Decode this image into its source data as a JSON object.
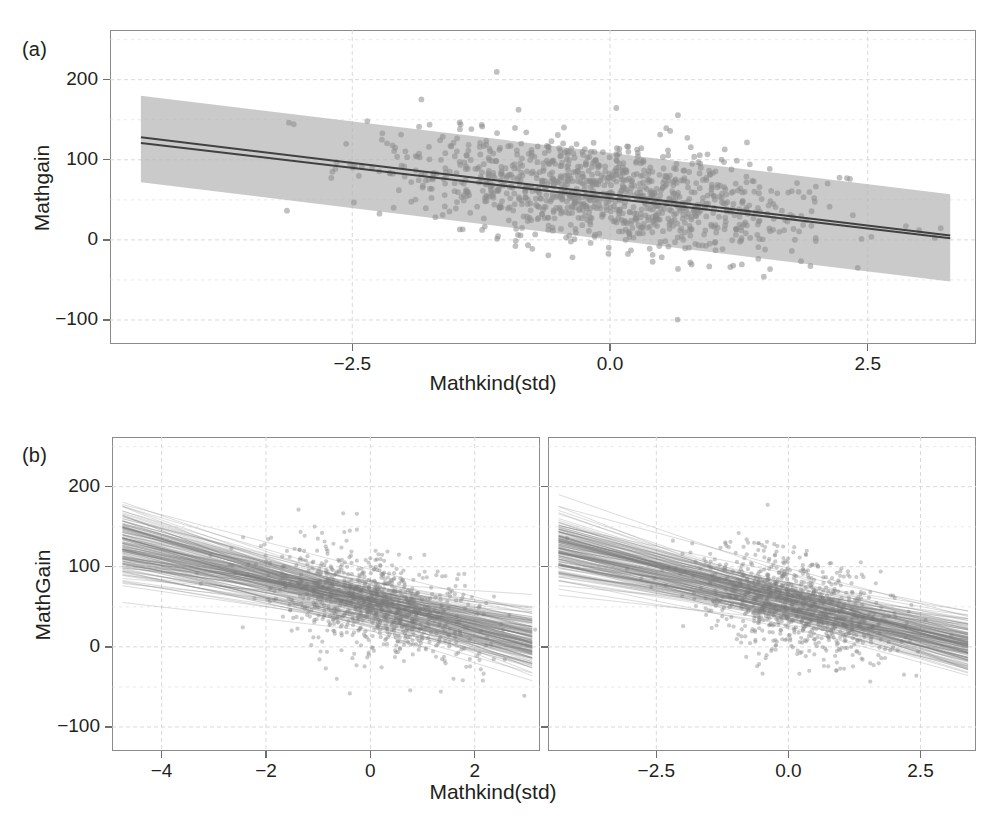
{
  "figure": {
    "panels": [
      {
        "letter": "(a)",
        "xlabel": "Mathkind(std)",
        "ylabel": "Mathgain"
      },
      {
        "letter": "(b)",
        "xlabel": "Mathkind(std)",
        "ylabel": "MathGain"
      }
    ]
  },
  "colors": {
    "point": "#8c8c8c",
    "band": "#b3b3b3",
    "line": "#3a3a3a",
    "spaghetti": "#7a7a7a",
    "grid": "#d8d8d8",
    "frame": "#8a8a8a",
    "text": "#231f20"
  },
  "chart_data": [
    {
      "type": "scatter",
      "panel": "(a)",
      "title": "",
      "xlabel": "Mathkind(std)",
      "ylabel": "Mathgain",
      "xlim": [
        -4.85,
        3.55
      ],
      "ylim": [
        -130,
        262
      ],
      "xticks": [
        -2.5,
        0.0,
        2.5
      ],
      "xticklabels": [
        "-2.5",
        "0.0",
        "2.5"
      ],
      "yticks": [
        -100,
        0,
        100,
        200
      ],
      "yticklabels": [
        "-100",
        "0",
        "100",
        "200"
      ],
      "grid": true,
      "grid_minor_y_step": 50,
      "legend": "none",
      "n_points": 1100,
      "point_cloud": {
        "x_mean": 0.0,
        "x_sd": 1.0,
        "y_intercept": 58,
        "y_slope": -15.6,
        "y_resid_sd": 32
      },
      "fit_lines": [
        {
          "name": "pooled-regression",
          "intercept": 57.0,
          "slope": -15.6,
          "x0": -4.55,
          "y0": 128.0,
          "x1": 3.3,
          "y1": 5.5
        },
        {
          "name": "multilevel-regression",
          "intercept": 52.0,
          "slope": -15.2,
          "x0": -4.55,
          "y0": 121.0,
          "x1": 3.3,
          "y1": 2.0
        }
      ],
      "confidence_band": {
        "name": "95% prediction interval",
        "x0": -4.55,
        "x1": 3.3,
        "upper_y0": 180.0,
        "upper_y1": 57.0,
        "lower_y0": 72.0,
        "lower_y1": -52.0
      }
    },
    {
      "type": "line",
      "panel": "(b)-left",
      "title": "",
      "xlabel": "Mathkind(std)",
      "ylabel": "MathGain",
      "xlim": [
        -4.95,
        3.25
      ],
      "ylim": [
        -130,
        262
      ],
      "xticks": [
        -4,
        -2,
        0,
        2
      ],
      "xticklabels": [
        "-4",
        "-2",
        "0",
        "2"
      ],
      "yticks": [
        -100,
        0,
        100,
        200
      ],
      "yticklabels": [
        "-100",
        "0",
        "100",
        "200"
      ],
      "grid": true,
      "grid_minor_y_step": 50,
      "legend": "none",
      "description": "posterior draw spaghetti lines over scatter",
      "n_lines": 170,
      "n_points": 900,
      "spaghetti": {
        "x0": -4.75,
        "x1": 3.1,
        "intercept_mean": 56.0,
        "intercept_spread": 14.0,
        "slope_mean": -15.5,
        "slope_spread": 4.0
      },
      "point_cloud": {
        "x_mean": 0.1,
        "x_sd": 0.95,
        "y_intercept": 56,
        "y_slope": -15.5,
        "y_resid_sd": 30
      }
    },
    {
      "type": "line",
      "panel": "(b)-right",
      "title": "",
      "xlabel": "Mathkind(std)",
      "ylabel": "",
      "xlim": [
        -4.55,
        3.55
      ],
      "ylim": [
        -130,
        262
      ],
      "xticks": [
        -2.5,
        0.0,
        2.5
      ],
      "xticklabels": [
        "-2.5",
        "0.0",
        "2.5"
      ],
      "yticks": [
        -100,
        0,
        100,
        200
      ],
      "yticklabels": [],
      "grid": true,
      "grid_minor_y_step": 50,
      "legend": "none",
      "description": "posterior draw spaghetti lines over scatter",
      "n_lines": 170,
      "n_points": 900,
      "spaghetti": {
        "x0": -4.35,
        "x1": 3.4,
        "intercept_mean": 56.0,
        "intercept_spread": 13.0,
        "slope_mean": -15.5,
        "slope_spread": 3.6
      },
      "point_cloud": {
        "x_mean": 0.1,
        "x_sd": 0.92,
        "y_intercept": 56,
        "y_slope": -15.5,
        "y_resid_sd": 30
      }
    }
  ]
}
